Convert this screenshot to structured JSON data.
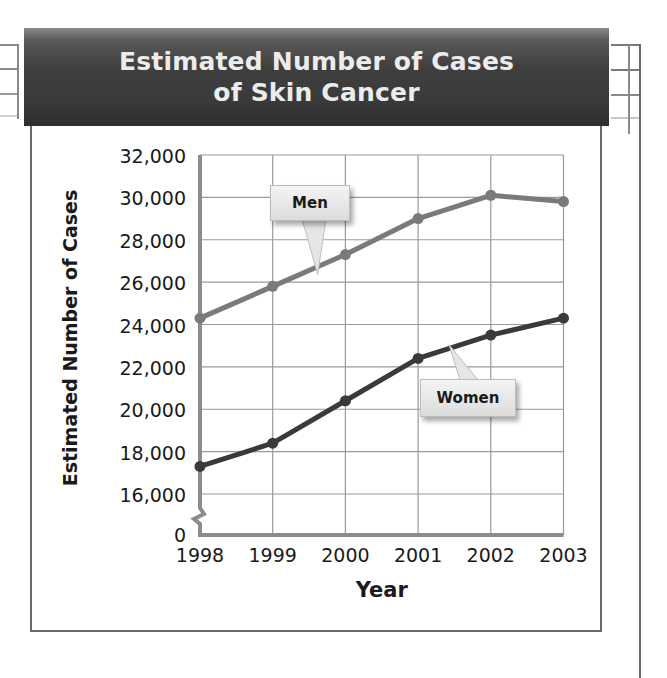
{
  "chart_data": {
    "type": "line",
    "title": "Estimated Number of Cases of Skin Cancer",
    "title_lines": [
      "Estimated Number of Cases",
      "of Skin Cancer"
    ],
    "xlabel": "Year",
    "ylabel": "Estimated Number of Cases",
    "categories": [
      "1998",
      "1999",
      "2000",
      "2001",
      "2002",
      "2003"
    ],
    "y_ticks": [
      "0",
      "16,000",
      "18,000",
      "20,000",
      "22,000",
      "24,000",
      "26,000",
      "28,000",
      "30,000",
      "32,000"
    ],
    "ylim": [
      16000,
      32000
    ],
    "axis_break": true,
    "grid": true,
    "legend": "callouts",
    "series": [
      {
        "name": "Men",
        "values": [
          24300,
          25800,
          27300,
          29000,
          30100,
          29800
        ],
        "color": "#7a7a7a"
      },
      {
        "name": "Women",
        "values": [
          17300,
          18400,
          20400,
          22400,
          23500,
          24300
        ],
        "color": "#3a3a3a"
      }
    ]
  },
  "labels": {
    "men": "Men",
    "women": "Women"
  },
  "colors": {
    "title_bar": "#3f3f3f",
    "title_text": "#ececec",
    "grid": "#9a9a9a",
    "axis": "#8c8c8c",
    "men_line": "#7a7a7a",
    "women_line": "#3a3a3a"
  }
}
